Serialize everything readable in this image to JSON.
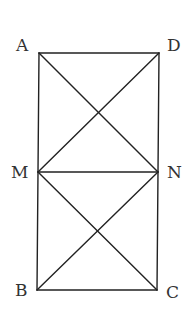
{
  "diagram": {
    "type": "geometry-figure",
    "stroke_color": "#222222",
    "label_color": "#333333",
    "points": {
      "A": {
        "label": "A",
        "x": 39,
        "y": 53
      },
      "D": {
        "label": "D",
        "x": 159,
        "y": 53
      },
      "M": {
        "label": "M",
        "x": 38,
        "y": 172
      },
      "N": {
        "label": "N",
        "x": 158,
        "y": 172
      },
      "B": {
        "label": "B",
        "x": 37,
        "y": 290
      },
      "C": {
        "label": "C",
        "x": 157,
        "y": 290
      }
    },
    "segments": [
      {
        "from": "A",
        "to": "D"
      },
      {
        "from": "A",
        "to": "B"
      },
      {
        "from": "D",
        "to": "C"
      },
      {
        "from": "B",
        "to": "C"
      },
      {
        "from": "M",
        "to": "N"
      },
      {
        "from": "A",
        "to": "N"
      },
      {
        "from": "D",
        "to": "M"
      },
      {
        "from": "M",
        "to": "C"
      },
      {
        "from": "N",
        "to": "B"
      }
    ]
  }
}
